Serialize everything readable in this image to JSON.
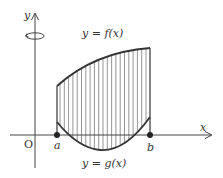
{
  "diagram": {
    "type": "solid-of-revolution-region",
    "axes": {
      "x_label": "x",
      "y_label": "y",
      "origin_label": "O"
    },
    "rotation_axis": "y",
    "points": [
      {
        "name": "a",
        "label": "a"
      },
      {
        "name": "b",
        "label": "b"
      }
    ],
    "curves": [
      {
        "name": "upper",
        "label": "y = f(x)"
      },
      {
        "name": "lower",
        "label": "y = g(x)"
      }
    ],
    "region": {
      "description": "area between f(x) and g(x) for a ≤ x ≤ b, shaded with vertical hatch lines"
    },
    "colors": {
      "curve": "#333333",
      "axis": "#444444",
      "hatch": "#888888",
      "text": "#333333"
    }
  }
}
